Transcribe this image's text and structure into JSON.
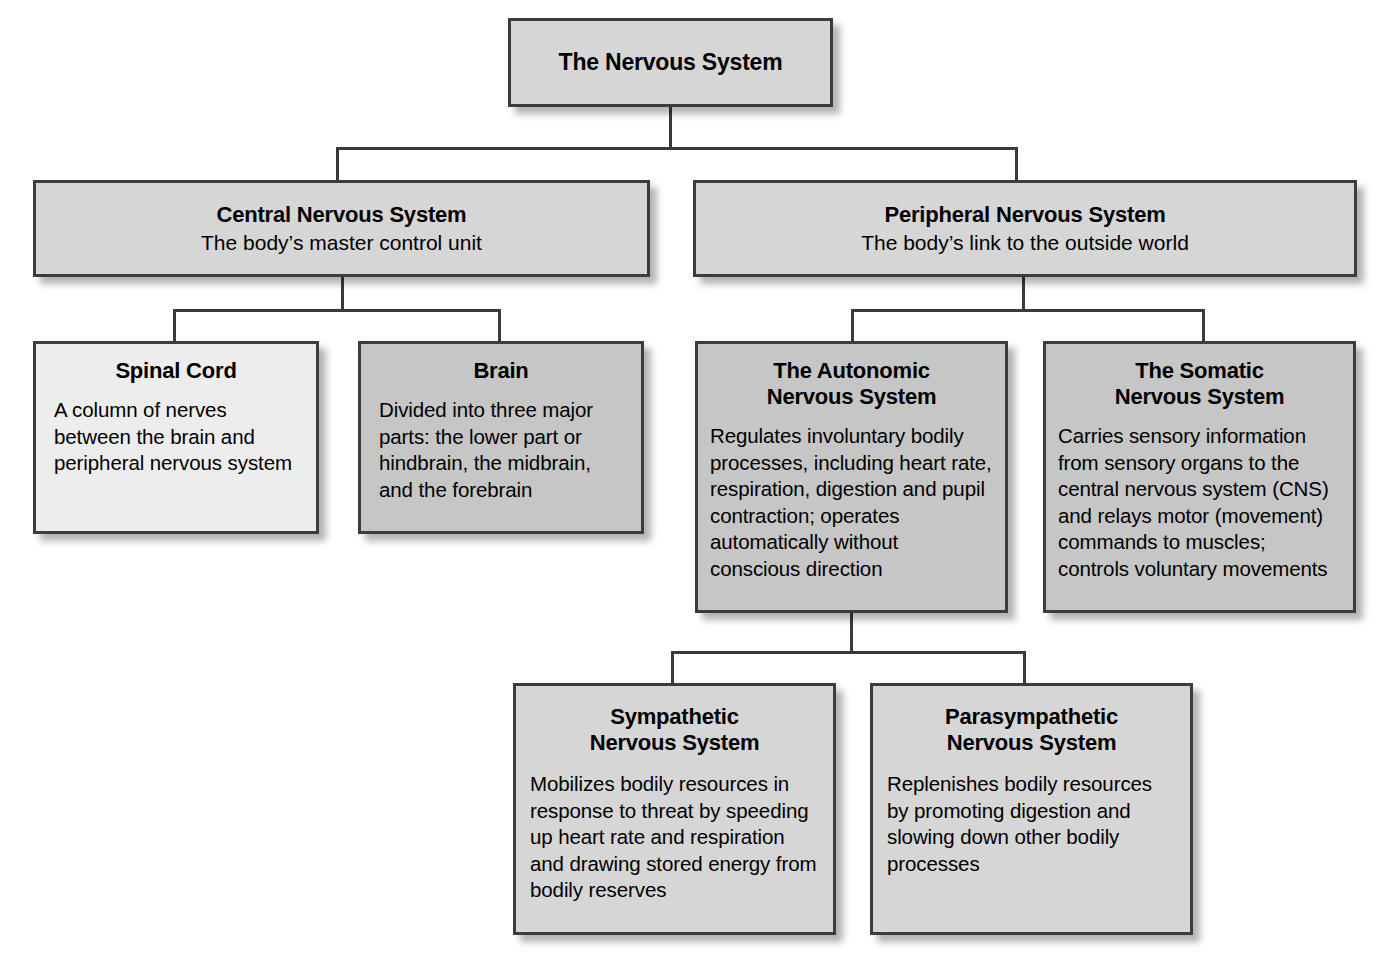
{
  "diagram": {
    "title": "The Nervous System",
    "nodes": {
      "root": {
        "title": "The Nervous System"
      },
      "cns": {
        "title": "Central Nervous System",
        "subtitle": "The body’s master control unit"
      },
      "pns": {
        "title": "Peripheral Nervous System",
        "subtitle": "The body’s link to the outside world"
      },
      "spinal_cord": {
        "title": "Spinal Cord",
        "body": "A column of nerves between the brain and peripheral nervous system"
      },
      "brain": {
        "title": "Brain",
        "body": "Divided into three major parts: the lower part or hindbrain, the midbrain, and the forebrain"
      },
      "autonomic": {
        "title": "The Autonomic\nNervous System",
        "body": "Regulates involuntary bodily processes, including heart rate, respiration, digestion and pupil contraction; operates automatically without conscious direction"
      },
      "somatic": {
        "title": "The Somatic\nNervous System",
        "body": "Carries sensory information from sensory organs to the central nervous system (CNS) and relays motor (movement) commands to muscles; controls voluntary movements"
      },
      "sympathetic": {
        "title": "Sympathetic\nNervous System",
        "body": "Mobilizes bodily resources in response to threat by speeding up heart rate and respiration and drawing stored energy from bodily reserves"
      },
      "parasympathetic": {
        "title": "Parasympathetic\nNervous System",
        "body": "Replenishes bodily resources by promoting digestion and slowing down other bodily processes"
      }
    },
    "colors": {
      "box_fill_light": "#ededed",
      "box_fill_mid": "#d6d6d6",
      "box_fill_dark": "#c6c6c6",
      "box_border": "#3c3c3c",
      "connector": "#3a3a3a",
      "text": "#000000",
      "background": "#ffffff"
    }
  }
}
